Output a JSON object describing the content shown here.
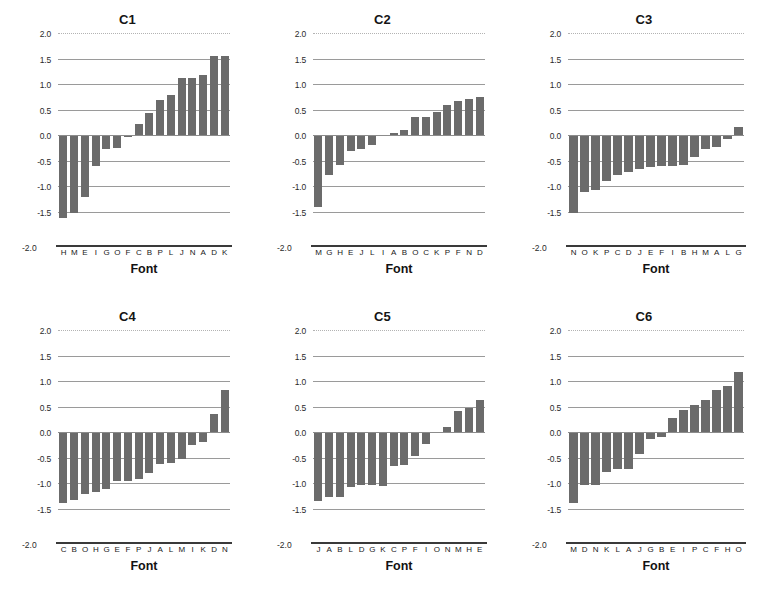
{
  "figure": {
    "bar_color": "#6b6b6b",
    "background": "#ffffff",
    "grid_color": "#9a9a9a",
    "panel_count": 6
  },
  "chart_data": [
    {
      "type": "bar",
      "title": "C1",
      "xlabel": "Font",
      "ylabel": "",
      "ylim": [
        -2.0,
        2.0
      ],
      "yticks": [
        "2.0",
        "1.5",
        "1.0",
        "0.5",
        "0.0",
        "-0.5",
        "-1.0",
        "-1.5",
        "-2.0"
      ],
      "ytick_values": [
        2.0,
        1.5,
        1.0,
        0.5,
        0.0,
        -0.5,
        -1.0,
        -1.5,
        -2.0
      ],
      "grid": true,
      "legend": "none",
      "categories": [
        "H",
        "M",
        "E",
        "I",
        "G",
        "O",
        "F",
        "C",
        "B",
        "P",
        "L",
        "J",
        "N",
        "A",
        "D",
        "K"
      ],
      "values": [
        -1.62,
        -1.52,
        -1.22,
        -0.6,
        -0.27,
        -0.25,
        -0.03,
        0.21,
        0.43,
        0.68,
        0.79,
        1.12,
        1.12,
        1.18,
        1.54,
        1.54
      ]
    },
    {
      "type": "bar",
      "title": "C2",
      "xlabel": "Font",
      "ylabel": "",
      "ylim": [
        -2.0,
        2.0
      ],
      "yticks": [
        "2.0",
        "1.5",
        "1.0",
        "0.5",
        "0.0",
        "-0.5",
        "-1.0",
        "-1.5",
        "-2.0"
      ],
      "ytick_values": [
        2.0,
        1.5,
        1.0,
        0.5,
        0.0,
        -0.5,
        -1.0,
        -1.5,
        -2.0
      ],
      "grid": true,
      "legend": "none",
      "categories": [
        "M",
        "G",
        "H",
        "E",
        "J",
        "L",
        "I",
        "A",
        "B",
        "O",
        "C",
        "K",
        "P",
        "F",
        "N",
        "D"
      ],
      "values": [
        -1.41,
        -0.78,
        -0.58,
        -0.32,
        -0.27,
        -0.19,
        0.0,
        0.04,
        0.09,
        0.36,
        0.36,
        0.46,
        0.58,
        0.67,
        0.71,
        0.74
      ]
    },
    {
      "type": "bar",
      "title": "C3",
      "xlabel": "Font",
      "ylabel": "",
      "ylim": [
        -2.0,
        2.0
      ],
      "yticks": [
        "2.0",
        "1.5",
        "1.0",
        "0.5",
        "0.0",
        "-0.5",
        "-1.0",
        "-1.5",
        "-2.0"
      ],
      "ytick_values": [
        2.0,
        1.5,
        1.0,
        0.5,
        0.0,
        -0.5,
        -1.0,
        -1.5,
        -2.0
      ],
      "grid": true,
      "legend": "none",
      "categories": [
        "N",
        "O",
        "K",
        "P",
        "C",
        "D",
        "J",
        "E",
        "F",
        "I",
        "B",
        "H",
        "M",
        "A",
        "L",
        "G"
      ],
      "values": [
        -1.53,
        -1.12,
        -1.08,
        -0.9,
        -0.79,
        -0.72,
        -0.66,
        -0.62,
        -0.6,
        -0.6,
        -0.58,
        -0.44,
        -0.27,
        -0.23,
        -0.07,
        0.15
      ]
    },
    {
      "type": "bar",
      "title": "C4",
      "xlabel": "Font",
      "ylabel": "",
      "ylim": [
        -2.0,
        2.0
      ],
      "yticks": [
        "2.0",
        "1.5",
        "1.0",
        "0.5",
        "0.0",
        "-0.5",
        "-1.0",
        "-1.5",
        "-2.0"
      ],
      "ytick_values": [
        2.0,
        1.5,
        1.0,
        0.5,
        0.0,
        -0.5,
        -1.0,
        -1.5,
        -2.0
      ],
      "grid": true,
      "legend": "none",
      "categories": [
        "C",
        "B",
        "O",
        "H",
        "G",
        "E",
        "F",
        "P",
        "J",
        "A",
        "L",
        "M",
        "I",
        "K",
        "D",
        "N"
      ],
      "values": [
        -1.39,
        -1.33,
        -1.22,
        -1.17,
        -1.11,
        -0.97,
        -0.97,
        -0.93,
        -0.8,
        -0.62,
        -0.6,
        -0.52,
        -0.25,
        -0.2,
        0.35,
        0.82
      ]
    },
    {
      "type": "bar",
      "title": "C5",
      "xlabel": "Font",
      "ylabel": "",
      "ylim": [
        -2.0,
        2.0
      ],
      "yticks": [
        "2.0",
        "1.5",
        "1.0",
        "0.5",
        "0.0",
        "-0.5",
        "-1.0",
        "-1.5",
        "-2.0"
      ],
      "ytick_values": [
        2.0,
        1.5,
        1.0,
        0.5,
        0.0,
        -0.5,
        -1.0,
        -1.5,
        -2.0
      ],
      "grid": true,
      "legend": "none",
      "categories": [
        "J",
        "A",
        "B",
        "L",
        "D",
        "G",
        "K",
        "C",
        "P",
        "F",
        "I",
        "O",
        "N",
        "M",
        "H",
        "E"
      ],
      "values": [
        -1.35,
        -1.27,
        -1.27,
        -1.08,
        -1.03,
        -1.03,
        -1.05,
        -0.67,
        -0.64,
        -0.47,
        -0.24,
        -0.02,
        0.09,
        0.42,
        0.48,
        0.62
      ]
    },
    {
      "type": "bar",
      "title": "C6",
      "xlabel": "Font",
      "ylabel": "",
      "ylim": [
        -2.0,
        2.0
      ],
      "yticks": [
        "2.0",
        "1.5",
        "1.0",
        "0.5",
        "0.0",
        "-0.5",
        "-1.0",
        "-1.5",
        "-2.0"
      ],
      "ytick_values": [
        2.0,
        1.5,
        1.0,
        0.5,
        0.0,
        -0.5,
        -1.0,
        -1.5,
        -2.0
      ],
      "grid": true,
      "legend": "none",
      "categories": [
        "M",
        "D",
        "N",
        "K",
        "L",
        "A",
        "J",
        "G",
        "B",
        "E",
        "I",
        "P",
        "C",
        "F",
        "H",
        "O"
      ],
      "values": [
        -1.4,
        -1.03,
        -1.03,
        -0.78,
        -0.72,
        -0.72,
        -0.43,
        -0.13,
        -0.1,
        0.27,
        0.43,
        0.53,
        0.63,
        0.83,
        0.9,
        1.17
      ]
    }
  ]
}
